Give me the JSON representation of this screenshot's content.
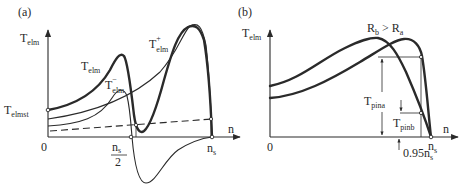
{
  "figure": {
    "panel_a": {
      "label": "(a)",
      "y_axis_label": {
        "main": "T",
        "sub": "elm"
      },
      "x_axis_label": "n",
      "origin_label": "0",
      "start_torque_label": {
        "main": "T",
        "sub": "elmst"
      },
      "tick_half_sync": {
        "numerator": "n",
        "numerator_sub": "s",
        "denominator": "2"
      },
      "tick_sync": {
        "main": "n",
        "sub": "s"
      },
      "curves": [
        {
          "name": "T_elm",
          "label_main": "T",
          "label_sub": "elm",
          "label_sup": "",
          "style": "thick"
        },
        {
          "name": "T_elm_minus",
          "label_main": "T",
          "label_sub": "elm",
          "label_sup": "−",
          "style": "thin"
        },
        {
          "name": "T_elm_plus",
          "label_main": "T",
          "label_sub": "elm",
          "label_sup": "+",
          "style": "thin"
        },
        {
          "name": "load_torque",
          "style": "dashed"
        }
      ]
    },
    "panel_b": {
      "label": "(b)",
      "y_axis_label": {
        "main": "T",
        "sub": "elm"
      },
      "x_axis_label": "n",
      "origin_label": "0",
      "resistance_relation": {
        "left_main": "R",
        "left_sub": "b",
        "op": ">",
        "right_main": "R",
        "right_sub": "a"
      },
      "tick_sync": {
        "main": "n",
        "sub": "s"
      },
      "tick_095": {
        "main": "0.95n",
        "sub": "s"
      },
      "pin_a": {
        "main": "T",
        "sub": "pina"
      },
      "pin_b": {
        "main": "T",
        "sub": "pinb"
      },
      "curves": [
        {
          "name": "T_elm_Ra",
          "style": "thick"
        },
        {
          "name": "T_elm_Rb",
          "style": "thick"
        }
      ]
    }
  }
}
